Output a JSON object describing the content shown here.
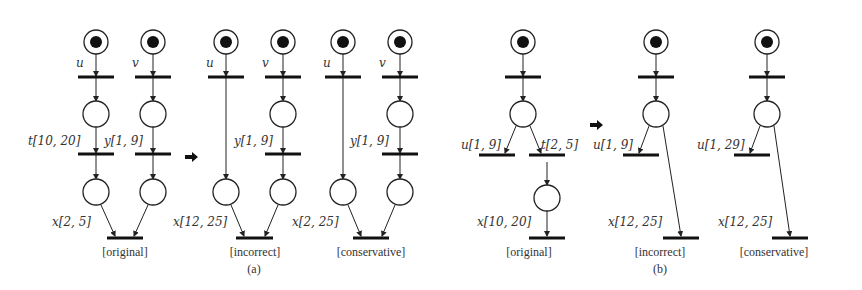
{
  "figure": {
    "part_a": {
      "caption": "(a)",
      "nets": [
        {
          "caption": "[original]",
          "labels": {
            "u": "u",
            "v": "v",
            "t": "t[10, 20]",
            "y": "y[1, 9]",
            "x": "x[2, 5]"
          }
        },
        {
          "caption": "[incorrect]",
          "labels": {
            "u": "u",
            "v": "v",
            "y": "y[1, 9]",
            "x": "x[12, 25]"
          }
        },
        {
          "caption": "[conservative]",
          "labels": {
            "u": "u",
            "v": "v",
            "y": "y[1, 9]",
            "x": "x[2, 25]"
          }
        }
      ]
    },
    "part_b": {
      "caption": "(b)",
      "nets": [
        {
          "caption": "[original]",
          "labels": {
            "u": "u[1, 9]",
            "t": "t[2, 5]",
            "x": "x[10, 20]"
          }
        },
        {
          "caption": "[incorrect]",
          "labels": {
            "u": "u[1, 9]",
            "x": "x[12, 25]"
          }
        },
        {
          "caption": "[conservative]",
          "labels": {
            "u": "u[1, 29]",
            "x": "x[12, 25]"
          }
        }
      ]
    }
  }
}
